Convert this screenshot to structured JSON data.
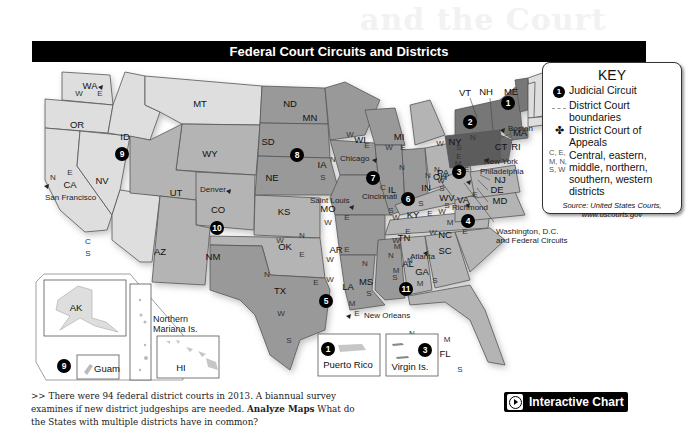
{
  "background_title": "and the Court",
  "map": {
    "title": "Federal Court Circuits and Districts",
    "states": [
      {
        "abbr": "WA",
        "districts": [
          "W",
          "E"
        ],
        "circuit": 9
      },
      {
        "abbr": "OR",
        "districts": [],
        "circuit": 9
      },
      {
        "abbr": "CA",
        "districts": [
          "N",
          "E",
          "C",
          "S"
        ],
        "circuit": 9
      },
      {
        "abbr": "NV",
        "districts": [],
        "circuit": 9
      },
      {
        "abbr": "ID",
        "districts": [],
        "circuit": 9
      },
      {
        "abbr": "MT",
        "districts": [],
        "circuit": 9
      },
      {
        "abbr": "AZ",
        "districts": [],
        "circuit": 9
      },
      {
        "abbr": "AK",
        "districts": [],
        "circuit": 9
      },
      {
        "abbr": "HI",
        "districts": [],
        "circuit": 9
      },
      {
        "abbr": "WY",
        "districts": [],
        "circuit": 10
      },
      {
        "abbr": "UT",
        "districts": [],
        "circuit": 10
      },
      {
        "abbr": "CO",
        "districts": [],
        "circuit": 10
      },
      {
        "abbr": "NM",
        "districts": [],
        "circuit": 10
      },
      {
        "abbr": "KS",
        "districts": [],
        "circuit": 10
      },
      {
        "abbr": "OK",
        "districts": [
          "W",
          "N",
          "E"
        ],
        "circuit": 10
      },
      {
        "abbr": "ND",
        "districts": [],
        "circuit": 8
      },
      {
        "abbr": "SD",
        "districts": [],
        "circuit": 8
      },
      {
        "abbr": "NE",
        "districts": [],
        "circuit": 8
      },
      {
        "abbr": "MN",
        "districts": [],
        "circuit": 8
      },
      {
        "abbr": "IA",
        "districts": [
          "N",
          "S"
        ],
        "circuit": 8
      },
      {
        "abbr": "MO",
        "districts": [
          "W",
          "E"
        ],
        "circuit": 8
      },
      {
        "abbr": "AR",
        "districts": [
          "W",
          "E"
        ],
        "circuit": 8
      },
      {
        "abbr": "WI",
        "districts": [
          "W",
          "E"
        ],
        "circuit": 7
      },
      {
        "abbr": "IL",
        "districts": [
          "N",
          "C",
          "S"
        ],
        "circuit": 7
      },
      {
        "abbr": "IN",
        "districts": [
          "N",
          "S"
        ],
        "circuit": 7
      },
      {
        "abbr": "MI",
        "districts": [
          "W",
          "E"
        ],
        "circuit": 6
      },
      {
        "abbr": "OH",
        "districts": [
          "N",
          "S"
        ],
        "circuit": 6
      },
      {
        "abbr": "KY",
        "districts": [
          "W",
          "E"
        ],
        "circuit": 6
      },
      {
        "abbr": "TN",
        "districts": [
          "W",
          "M",
          "E"
        ],
        "circuit": 6
      },
      {
        "abbr": "TX",
        "districts": [
          "N",
          "E",
          "W",
          "S"
        ],
        "circuit": 5
      },
      {
        "abbr": "LA",
        "districts": [
          "W",
          "M",
          "E"
        ],
        "circuit": 5
      },
      {
        "abbr": "MS",
        "districts": [
          "N",
          "S"
        ],
        "circuit": 5
      },
      {
        "abbr": "AL",
        "districts": [
          "N",
          "M",
          "S"
        ],
        "circuit": 11
      },
      {
        "abbr": "GA",
        "districts": [
          "N",
          "M",
          "S"
        ],
        "circuit": 11
      },
      {
        "abbr": "FL",
        "districts": [
          "N",
          "M",
          "S"
        ],
        "circuit": 11
      },
      {
        "abbr": "WV",
        "districts": [
          "N",
          "S"
        ],
        "circuit": 4
      },
      {
        "abbr": "VA",
        "districts": [
          "W",
          "E"
        ],
        "circuit": 4
      },
      {
        "abbr": "NC",
        "districts": [
          "W",
          "M",
          "E"
        ],
        "circuit": 4
      },
      {
        "abbr": "SC",
        "districts": [],
        "circuit": 4
      },
      {
        "abbr": "MD",
        "districts": [],
        "circuit": 4
      },
      {
        "abbr": "PA",
        "districts": [
          "W",
          "M",
          "E"
        ],
        "circuit": 3
      },
      {
        "abbr": "NJ",
        "districts": [],
        "circuit": 3
      },
      {
        "abbr": "DE",
        "districts": [],
        "circuit": 3
      },
      {
        "abbr": "NY",
        "districts": [
          "W",
          "N",
          "S",
          "E"
        ],
        "circuit": 2
      },
      {
        "abbr": "VT",
        "districts": [],
        "circuit": 2
      },
      {
        "abbr": "CT",
        "districts": [],
        "circuit": 2
      },
      {
        "abbr": "ME",
        "districts": [],
        "circuit": 1
      },
      {
        "abbr": "NH",
        "districts": [],
        "circuit": 1
      },
      {
        "abbr": "MA",
        "districts": [],
        "circuit": 1
      },
      {
        "abbr": "RI",
        "districts": [],
        "circuit": 1
      }
    ],
    "circuits": [
      "1",
      "2",
      "3",
      "4",
      "5",
      "6",
      "7",
      "8",
      "9",
      "10",
      "11"
    ],
    "cities": {
      "san_francisco": "San Francisco",
      "denver": "Denver",
      "saint_louis": "Saint Louis",
      "chicago": "Chicago",
      "cincinnati": "Cincinnati",
      "new_orleans": "New Orleans",
      "atlanta": "Atlanta",
      "richmond": "Richmond",
      "boston": "Boston",
      "new_york": "New York",
      "philadelphia": "Philadelphia",
      "washington": "Washington, D.C.",
      "washington_line2": "and Federal Circuits"
    },
    "insets": {
      "alaska": "AK",
      "guam": "Guam",
      "northern_mariana": "Northern",
      "northern_mariana_line2": "Mariana Is.",
      "hawaii": "HI",
      "puerto_rico": "Puerto Rico",
      "virgin_islands": "Virgin Is."
    },
    "colors": {
      "light": "#dedede",
      "mid": "#b4b4b4",
      "dark": "#8e8e8e",
      "darkest": "#5c5c5c",
      "border": "#555555"
    }
  },
  "key": {
    "title": "KEY",
    "judicial_circuit": "Judicial Circuit",
    "district_boundaries_1": "District Court",
    "district_boundaries_2": "boundaries",
    "court_of_appeals_1": "District Court of",
    "court_of_appeals_2": "Appeals",
    "abbr_symbols": "C, E, M, N, S, W",
    "abbr_meaning_1": "Central, eastern,",
    "abbr_meaning_2": "middle, northern,",
    "abbr_meaning_3": "southern, western",
    "abbr_meaning_4": "districts",
    "source_1": "Source: United States Courts,",
    "source_2": "www.uscourts.gov"
  },
  "caption": {
    "prefix": ">> There were 94 federal district courts in 2013. A biannual survey examines if new district judgeships are needed. ",
    "bold": "Analyze Maps",
    "suffix": "  What do the States with multiple districts have in common?"
  },
  "interactive_chart": {
    "label": "Interactive Chart",
    "icon": "play-icon"
  }
}
